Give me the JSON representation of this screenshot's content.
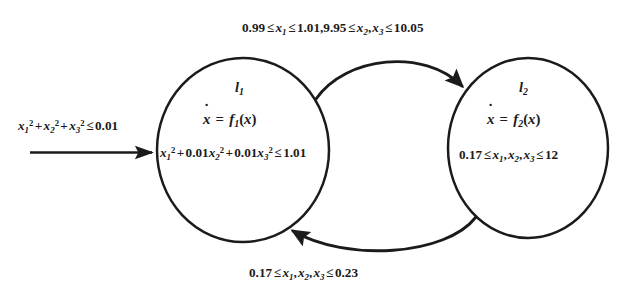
{
  "diagram": {
    "type": "hybrid-automaton-state-transition-diagram",
    "background_color": "#ffffff",
    "stroke_color": "#1b1b1b",
    "text_color": "#1b1b1b",
    "canvas": {
      "width": 639,
      "height": 302
    },
    "initial_transition": {
      "label": "x₁² + x₂² + x₃² ≤0.01",
      "label_parts": {
        "terms": [
          "x₁²",
          "x₂²",
          "x₃²"
        ],
        "relation": "≤",
        "bound": "0.01"
      },
      "arrow_direction": "right",
      "target": "l₁"
    },
    "locations": [
      {
        "id": "l1",
        "name": "l₁",
        "dynamics": "ẋ = f₁(x)",
        "dynamics_parts": {
          "lhs": "ẋ",
          "eq": "=",
          "fn": "f₁",
          "arg": "(x)"
        },
        "invariant": "x₁² + 0.01x₂² + 0.01x₃² ≤1.01",
        "invariant_parts": {
          "terms": [
            "x₁²",
            "0.01x₂²",
            "0.01x₃²"
          ],
          "relation": "≤",
          "bound": "1.01"
        },
        "center": {
          "x": 243,
          "y": 150
        },
        "radius_x": 86,
        "radius_y": 92
      },
      {
        "id": "l2",
        "name": "l₂",
        "dynamics": "ẋ = f₂(x)",
        "dynamics_parts": {
          "lhs": "ẋ",
          "eq": "=",
          "fn": "f₂",
          "arg": "(x)"
        },
        "invariant": "0.17 ≤ x₁, x₂, x₃ ≤ 12",
        "invariant_parts": {
          "lower": "0.17",
          "relation": "≤",
          "vars": [
            "x₁",
            "x₂",
            "x₃"
          ],
          "upper": "12"
        },
        "center": {
          "x": 528,
          "y": 148
        },
        "radius_x": 80,
        "radius_y": 90
      }
    ],
    "transitions": [
      {
        "id": "t-l1-to-l2",
        "from": "l₁",
        "to": "l₂",
        "position": "top",
        "curve": "arc-over",
        "guard": "0.99 ≤ x₁ ≤ 1.01,9.95 ≤ x₂, x₃ ≤ 10.05",
        "guard_parts": {
          "first_lower": "0.99",
          "first_var": "x₁",
          "first_upper": "1.01",
          "second_lower": "9.95",
          "second_vars": [
            "x₂",
            "x₃"
          ],
          "second_upper": "10.05",
          "relation": "≤"
        }
      },
      {
        "id": "t-l2-to-l1",
        "from": "l₂",
        "to": "l₁",
        "position": "bottom",
        "curve": "arc-under",
        "guard": "0.17 ≤ x₁, x₂, x₃ ≤ 0.23",
        "guard_parts": {
          "lower": "0.17",
          "relation": "≤",
          "vars": [
            "x₁",
            "x₂",
            "x₃"
          ],
          "upper": "0.23"
        }
      }
    ],
    "symbols": {
      "le": "≤",
      "plus": "+",
      "eq": "=",
      "comma": ",",
      "dot_accent": "˙"
    }
  }
}
